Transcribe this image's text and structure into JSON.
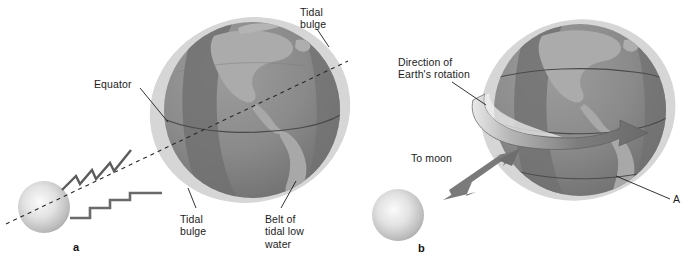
{
  "figure": {
    "background": "#ffffff",
    "colors": {
      "globe_dark": "#7e7e7e",
      "globe_mid": "#8f8f8f",
      "continent": "#a8a8a8",
      "belt_dark": "#6f6f6f",
      "bulge_halo": "#d6d6d6",
      "moon_light": "#f0f0f0",
      "moon_edge": "#a9a9a9",
      "arrow_gray": "#7a7a7a",
      "line_black": "#1c1c1c",
      "text": "#1c1c1c"
    }
  },
  "panels": [
    {
      "letter": "a",
      "name": "tidal-bulge-panel",
      "labels": [
        {
          "name": "tidal-bulge-top",
          "text": "Tidal\nbulge"
        },
        {
          "name": "equator",
          "text": "Equator"
        },
        {
          "name": "tidal-bulge-bottom",
          "text": "Tidal\nbulge"
        },
        {
          "name": "belt-of-tidal-low-water",
          "text": "Belt of\ntidal low\nwater"
        }
      ]
    },
    {
      "letter": "b",
      "name": "earth-rotation-panel",
      "labels": [
        {
          "name": "direction-of-earths-rotation",
          "text": "Direction of\nEarth's rotation"
        },
        {
          "name": "to-moon",
          "text": "To moon"
        },
        {
          "name": "point-a",
          "text": "A"
        }
      ]
    }
  ]
}
